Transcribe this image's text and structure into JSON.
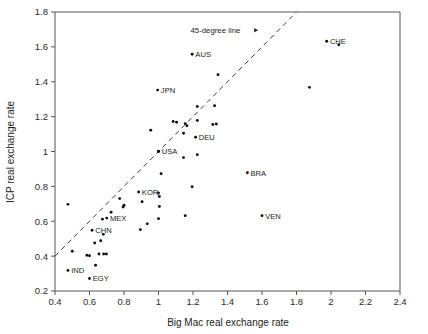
{
  "chart_data": {
    "type": "scatter",
    "title": "",
    "xlabel": "Big Mac real exchange rate",
    "ylabel": "ICP real exchange rate",
    "xlim": [
      0.4,
      2.4
    ],
    "ylim": [
      0.2,
      1.8
    ],
    "xticks": [
      "0.4",
      "0.6",
      "0.8",
      "1",
      "1.2",
      "1.4",
      "1.6",
      "1.8",
      "2",
      "2.2",
      "2.4"
    ],
    "xtick_values": [
      0.4,
      0.6,
      0.8,
      1.0,
      1.2,
      1.4,
      1.6,
      1.8,
      2.0,
      2.2,
      2.4
    ],
    "yticks": [
      "0.2",
      "0.4",
      "0.6",
      "0.8",
      "1",
      "1.2",
      "1.4",
      "1.6",
      "1.8"
    ],
    "ytick_values": [
      0.2,
      0.4,
      0.6,
      0.8,
      1.0,
      1.2,
      1.4,
      1.6,
      1.8
    ],
    "grid": false,
    "legend": null,
    "annotations": [
      {
        "text": "45-degree line",
        "x": 1.33,
        "y": 1.695,
        "arrow_to_x": 1.575,
        "arrow_to_y": 1.695
      }
    ],
    "reference_line": {
      "label": "45-degree line",
      "type": "dashed",
      "from": [
        0.4,
        0.4
      ],
      "to": [
        1.8,
        1.8
      ]
    },
    "labeled_points": [
      {
        "label": "CHE",
        "x": 1.975,
        "y": 1.632,
        "label_side": "right"
      },
      {
        "label": "AUS",
        "x": 1.195,
        "y": 1.558,
        "label_side": "right"
      },
      {
        "label": "JPN",
        "x": 0.995,
        "y": 1.352,
        "label_side": "right"
      },
      {
        "label": "DEU",
        "x": 1.215,
        "y": 1.082,
        "label_side": "right"
      },
      {
        "label": "USA",
        "x": 1.0,
        "y": 1.0,
        "label_side": "right"
      },
      {
        "label": "BRA",
        "x": 1.515,
        "y": 0.878,
        "label_side": "right"
      },
      {
        "label": "KOR",
        "x": 0.885,
        "y": 0.768,
        "label_side": "right"
      },
      {
        "label": "VEN",
        "x": 1.6,
        "y": 0.632,
        "label_side": "right"
      },
      {
        "label": "MEX",
        "x": 0.7,
        "y": 0.618,
        "label_side": "right"
      },
      {
        "label": "CHN",
        "x": 0.615,
        "y": 0.548,
        "label_side": "right"
      },
      {
        "label": "IND",
        "x": 0.475,
        "y": 0.318,
        "label_side": "right"
      },
      {
        "label": "EGY",
        "x": 0.6,
        "y": 0.272,
        "label_side": "right"
      }
    ],
    "unlabeled_points": [
      {
        "x": 2.045,
        "y": 1.612
      },
      {
        "x": 1.875,
        "y": 1.368
      },
      {
        "x": 1.345,
        "y": 1.44
      },
      {
        "x": 1.325,
        "y": 1.262
      },
      {
        "x": 1.225,
        "y": 1.258
      },
      {
        "x": 1.335,
        "y": 1.158
      },
      {
        "x": 1.315,
        "y": 1.155
      },
      {
        "x": 1.225,
        "y": 1.178
      },
      {
        "x": 1.085,
        "y": 1.172
      },
      {
        "x": 1.105,
        "y": 1.168
      },
      {
        "x": 1.155,
        "y": 1.16
      },
      {
        "x": 1.165,
        "y": 1.148
      },
      {
        "x": 1.145,
        "y": 1.105
      },
      {
        "x": 0.955,
        "y": 1.122
      },
      {
        "x": 1.0,
        "y": 1.002
      },
      {
        "x": 1.225,
        "y": 0.982
      },
      {
        "x": 1.145,
        "y": 0.965
      },
      {
        "x": 1.015,
        "y": 0.872
      },
      {
        "x": 1.195,
        "y": 0.798
      },
      {
        "x": 1.0,
        "y": 0.762
      },
      {
        "x": 1.005,
        "y": 0.742
      },
      {
        "x": 0.905,
        "y": 0.712
      },
      {
        "x": 1.005,
        "y": 0.685
      },
      {
        "x": 0.475,
        "y": 0.697
      },
      {
        "x": 0.775,
        "y": 0.73
      },
      {
        "x": 0.8,
        "y": 0.692
      },
      {
        "x": 0.795,
        "y": 0.682
      },
      {
        "x": 0.725,
        "y": 0.652
      },
      {
        "x": 0.675,
        "y": 0.612
      },
      {
        "x": 1.155,
        "y": 0.632
      },
      {
        "x": 1.0,
        "y": 0.615
      },
      {
        "x": 0.935,
        "y": 0.585
      },
      {
        "x": 0.895,
        "y": 0.552
      },
      {
        "x": 0.63,
        "y": 0.475
      },
      {
        "x": 0.665,
        "y": 0.488
      },
      {
        "x": 0.68,
        "y": 0.525
      },
      {
        "x": 0.5,
        "y": 0.428
      },
      {
        "x": 0.585,
        "y": 0.405
      },
      {
        "x": 0.6,
        "y": 0.402
      },
      {
        "x": 0.655,
        "y": 0.412
      },
      {
        "x": 0.682,
        "y": 0.412
      },
      {
        "x": 0.698,
        "y": 0.412
      },
      {
        "x": 0.635,
        "y": 0.348
      }
    ],
    "plot_area_px": {
      "left": 55,
      "right": 400,
      "top": 12,
      "bottom": 291
    }
  }
}
